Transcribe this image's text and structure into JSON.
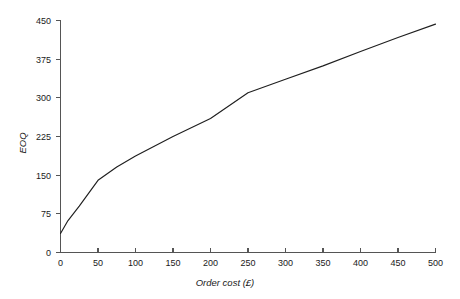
{
  "chart_data": {
    "type": "line",
    "title": "",
    "xlabel": "Order cost (£)",
    "ylabel": "EOQ",
    "xlim": [
      0,
      500
    ],
    "ylim": [
      0,
      450
    ],
    "xticks": [
      0,
      50,
      100,
      150,
      200,
      250,
      300,
      350,
      400,
      450,
      500
    ],
    "xtick_labels": [
      "0",
      "50",
      "100",
      "150",
      "200",
      "250",
      "300",
      "350",
      "400",
      "450",
      "500"
    ],
    "yticks": [
      0,
      75,
      150,
      225,
      300,
      375,
      450
    ],
    "ytick_labels": [
      "0",
      "75",
      "150",
      "225",
      "300",
      "375",
      "450"
    ],
    "grid": false,
    "legend": false,
    "legend_position": "none",
    "series": [
      {
        "name": "EOQ",
        "color": "#1f1f1f",
        "x": [
          0,
          10,
          25,
          50,
          75,
          100,
          150,
          200,
          250,
          300,
          350,
          400,
          450,
          500
        ],
        "y": [
          37,
          62,
          90,
          140,
          166,
          187,
          225,
          260,
          310,
          336,
          362,
          390,
          417,
          443
        ]
      }
    ]
  },
  "axes": {
    "x_axis_name": "x-axis",
    "y_axis_name": "y-axis"
  }
}
